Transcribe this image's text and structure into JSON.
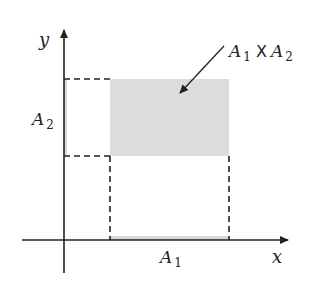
{
  "diagram": {
    "type": "cartesian-product-illustration",
    "axes": {
      "x_label": "x",
      "y_label": "y"
    },
    "sets": {
      "a1": {
        "symbol": "A",
        "subscript": "1",
        "axis": "x"
      },
      "a2": {
        "symbol": "A",
        "subscript": "2",
        "axis": "y"
      }
    },
    "product_label": {
      "left_symbol": "A",
      "left_subscript": "1",
      "operator": "X",
      "right_symbol": "A",
      "right_subscript": "2"
    },
    "colors": {
      "axis": "#222222",
      "region_fill": "#dcdcdc",
      "dashed": "#222222"
    },
    "geometry": {
      "origin": [
        64,
        240
      ],
      "region": {
        "x1": 110,
        "x2": 229,
        "y1": 79,
        "y2": 156
      }
    }
  }
}
